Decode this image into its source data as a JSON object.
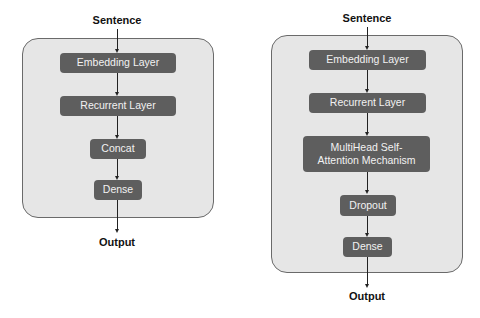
{
  "colors": {
    "container_bg": "#e6e6e6",
    "node_bg": "#5e5e5e",
    "node_text": "#f2f2f2",
    "arrow": "#222222"
  },
  "left": {
    "input_label": "Sentence",
    "output_label": "Output",
    "nodes": [
      "Embedding Layer",
      "Recurrent Layer",
      "Concat",
      "Dense"
    ]
  },
  "right": {
    "input_label": "Sentence",
    "output_label": "Output",
    "nodes": [
      "Embedding Layer",
      "Recurrent Layer",
      "MultiHead Self-Attention Mechanism",
      "Dropout",
      "Dense"
    ]
  }
}
